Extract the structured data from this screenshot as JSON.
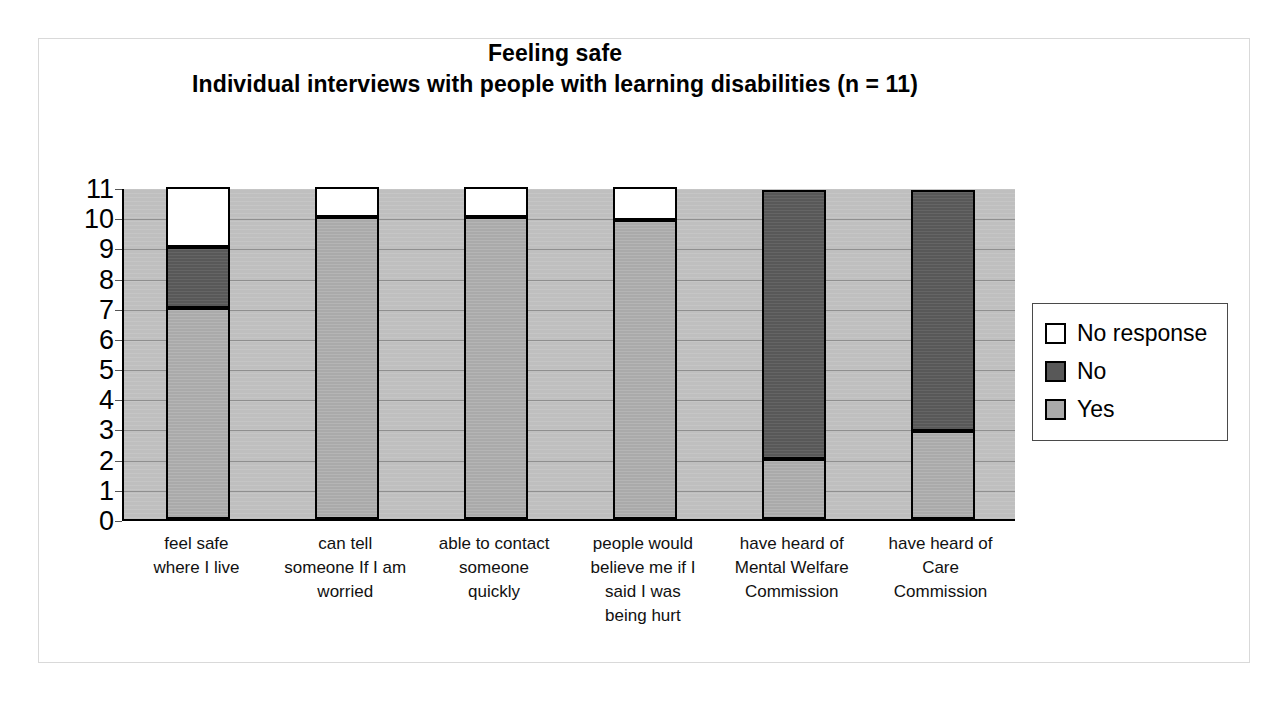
{
  "chart_data": {
    "type": "bar",
    "subtype": "stacked-bar",
    "title": "Feeling safe",
    "subtitle": "Individual interviews with people with learning disabilities (n = 11)",
    "xlabel": "",
    "ylabel": "",
    "ylim": [
      0,
      11
    ],
    "ytick_labels": [
      "0",
      "1",
      "2",
      "3",
      "4",
      "5",
      "6",
      "7",
      "8",
      "9",
      "10",
      "11"
    ],
    "ytick_values": [
      0,
      1,
      2,
      3,
      4,
      5,
      6,
      7,
      8,
      9,
      10,
      11
    ],
    "grid": true,
    "grid_axis": "y",
    "legend_position": "right",
    "categories": [
      "feel safe where I live",
      "can tell someone If I am worried",
      "able to contact someone quickly",
      "people would believe me if I said I was being hurt",
      "have heard of Mental Welfare Commission",
      "have heard of Care Commission"
    ],
    "category_label_lines": [
      [
        "feel safe",
        "where I live"
      ],
      [
        "can tell",
        "someone If I am",
        "worried"
      ],
      [
        "able to contact",
        "someone",
        "quickly"
      ],
      [
        "people would",
        "believe me if I",
        "said I was",
        "being hurt"
      ],
      [
        "have heard of",
        "Mental Welfare",
        "Commission"
      ],
      [
        "have heard of",
        "Care",
        "Commission"
      ]
    ],
    "series": [
      {
        "name": "Yes",
        "color": "#aaaaaa",
        "values": [
          7,
          10,
          10,
          9.9,
          2,
          2.9
        ]
      },
      {
        "name": "No",
        "color": "#585858",
        "values": [
          2,
          0,
          0,
          0,
          8.9,
          8
        ]
      },
      {
        "name": "No response",
        "color": "#ffffff",
        "values": [
          2,
          1,
          1,
          1.1,
          0,
          0
        ]
      }
    ],
    "stack_order_bottom_to_top": [
      "Yes",
      "No",
      "No response"
    ]
  },
  "legend": {
    "items": [
      {
        "label": "No response",
        "swatch": "white"
      },
      {
        "label": "No",
        "swatch": "dark-gray"
      },
      {
        "label": "Yes",
        "swatch": "light-gray"
      }
    ]
  },
  "colors": {
    "plot_background": "#bfbfbf",
    "gridline": "#8f8f8f",
    "axis": "#000000",
    "yes": "#aaaaaa",
    "no": "#585858",
    "no_response": "#ffffff",
    "frame": "#d9d9d9"
  }
}
